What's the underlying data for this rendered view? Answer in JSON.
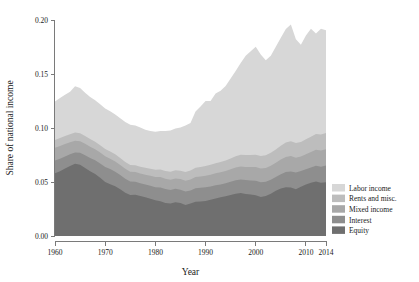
{
  "chart_data": {
    "type": "area",
    "stacked": true,
    "title": "",
    "xlabel": "Year",
    "ylabel": "Share of national income",
    "xlim": [
      1960,
      2014
    ],
    "ylim": [
      0.0,
      0.2
    ],
    "grid": false,
    "legend_position": "right",
    "xticks": [
      1960,
      1970,
      1980,
      1990,
      2000,
      2010,
      2014
    ],
    "xtick_labels": [
      "1960",
      "1970",
      "1980",
      "1990",
      "2000",
      "2010",
      "2014"
    ],
    "yticks": [
      0.0,
      0.05,
      0.1,
      0.15,
      0.2
    ],
    "ytick_labels": [
      "0.00",
      "0.05",
      "0.10",
      "0.15",
      "0.20"
    ],
    "x": [
      1960,
      1961,
      1962,
      1963,
      1964,
      1965,
      1966,
      1967,
      1968,
      1969,
      1970,
      1971,
      1972,
      1973,
      1974,
      1975,
      1976,
      1977,
      1978,
      1979,
      1980,
      1981,
      1982,
      1983,
      1984,
      1985,
      1986,
      1987,
      1988,
      1989,
      1990,
      1991,
      1992,
      1993,
      1994,
      1995,
      1996,
      1997,
      1998,
      1999,
      2000,
      2001,
      2002,
      2003,
      2004,
      2005,
      2006,
      2007,
      2008,
      2009,
      2010,
      2011,
      2012,
      2013,
      2014
    ],
    "series": [
      {
        "name": "Equity",
        "color": "#6f6f6f",
        "values": [
          0.058,
          0.06,
          0.0625,
          0.0648,
          0.0668,
          0.066,
          0.063,
          0.06,
          0.0575,
          0.054,
          0.05,
          0.048,
          0.046,
          0.0432,
          0.04,
          0.038,
          0.0382,
          0.037,
          0.0358,
          0.0345,
          0.033,
          0.0322,
          0.0305,
          0.03,
          0.0312,
          0.0305,
          0.0288,
          0.03,
          0.0318,
          0.032,
          0.0325,
          0.0335,
          0.0348,
          0.0358,
          0.0368,
          0.038,
          0.0392,
          0.0398,
          0.039,
          0.0385,
          0.0378,
          0.0362,
          0.037,
          0.0392,
          0.0418,
          0.044,
          0.0452,
          0.0448,
          0.0432,
          0.0455,
          0.0478,
          0.0492,
          0.0505,
          0.0492,
          0.0498
        ]
      },
      {
        "name": "Interest",
        "color": "#8e8e8e",
        "values": [
          0.0118,
          0.0116,
          0.0112,
          0.0108,
          0.0105,
          0.011,
          0.0118,
          0.0122,
          0.0126,
          0.0132,
          0.014,
          0.014,
          0.0135,
          0.0132,
          0.013,
          0.0124,
          0.012,
          0.0118,
          0.0118,
          0.012,
          0.0122,
          0.0128,
          0.013,
          0.0126,
          0.0125,
          0.0124,
          0.0124,
          0.0122,
          0.0124,
          0.0126,
          0.0126,
          0.0124,
          0.0122,
          0.012,
          0.012,
          0.0122,
          0.0124,
          0.0126,
          0.0128,
          0.013,
          0.0134,
          0.0136,
          0.0132,
          0.0128,
          0.0128,
          0.0132,
          0.014,
          0.015,
          0.0155,
          0.0146,
          0.014,
          0.0142,
          0.0146,
          0.015,
          0.0154
        ]
      },
      {
        "name": "Mixed income",
        "color": "#a8a8a8",
        "values": [
          0.012,
          0.0118,
          0.0115,
          0.0112,
          0.011,
          0.0108,
          0.0106,
          0.0104,
          0.0102,
          0.01,
          0.0098,
          0.0096,
          0.0095,
          0.0094,
          0.0092,
          0.009,
          0.009,
          0.009,
          0.0091,
          0.0092,
          0.0094,
          0.0096,
          0.0096,
          0.0095,
          0.0096,
          0.0098,
          0.01,
          0.0102,
          0.0104,
          0.0106,
          0.0108,
          0.0108,
          0.011,
          0.0112,
          0.0114,
          0.0116,
          0.0118,
          0.012,
          0.0122,
          0.0124,
          0.0126,
          0.0126,
          0.0128,
          0.013,
          0.0132,
          0.0136,
          0.014,
          0.0142,
          0.0138,
          0.0136,
          0.014,
          0.0144,
          0.0148,
          0.015,
          0.0152
        ]
      },
      {
        "name": "Rents and misc.",
        "color": "#bdbdbd",
        "values": [
          0.0072,
          0.0073,
          0.0074,
          0.0075,
          0.0076,
          0.0074,
          0.0072,
          0.0071,
          0.007,
          0.0069,
          0.0068,
          0.0067,
          0.0066,
          0.0065,
          0.0064,
          0.0063,
          0.0063,
          0.0064,
          0.0065,
          0.0066,
          0.0068,
          0.007,
          0.0072,
          0.0074,
          0.0076,
          0.0078,
          0.008,
          0.0082,
          0.0086,
          0.0088,
          0.009,
          0.0092,
          0.0094,
          0.0096,
          0.0098,
          0.01,
          0.0104,
          0.0108,
          0.011,
          0.0112,
          0.0114,
          0.0116,
          0.0118,
          0.012,
          0.0124,
          0.0128,
          0.0134,
          0.0138,
          0.0136,
          0.0134,
          0.0138,
          0.0142,
          0.0146,
          0.0148,
          0.015
        ]
      },
      {
        "name": "Labor income",
        "color": "#d7d7d7",
        "values": [
          0.0356,
          0.037,
          0.0382,
          0.0392,
          0.0428,
          0.0418,
          0.04,
          0.039,
          0.0384,
          0.0378,
          0.0374,
          0.0372,
          0.037,
          0.0368,
          0.037,
          0.0372,
          0.0368,
          0.0362,
          0.0352,
          0.035,
          0.0352,
          0.0356,
          0.037,
          0.0382,
          0.0386,
          0.04,
          0.043,
          0.044,
          0.052,
          0.056,
          0.06,
          0.059,
          0.0645,
          0.066,
          0.069,
          0.074,
          0.079,
          0.085,
          0.092,
          0.096,
          0.1,
          0.094,
          0.088,
          0.09,
          0.095,
          0.1,
          0.105,
          0.108,
          0.096,
          0.09,
          0.096,
          0.1,
          0.093,
          0.098,
          0.095
        ]
      }
    ]
  },
  "legend": {
    "entries": [
      {
        "label": "Labor income",
        "color": "#d7d7d7"
      },
      {
        "label": "Rents and misc.",
        "color": "#bdbdbd"
      },
      {
        "label": "Mixed income",
        "color": "#a8a8a8"
      },
      {
        "label": "Interest",
        "color": "#8e8e8e"
      },
      {
        "label": "Equity",
        "color": "#6f6f6f"
      }
    ]
  },
  "axes": {
    "x_title": "Year",
    "y_title": "Share of national income"
  }
}
